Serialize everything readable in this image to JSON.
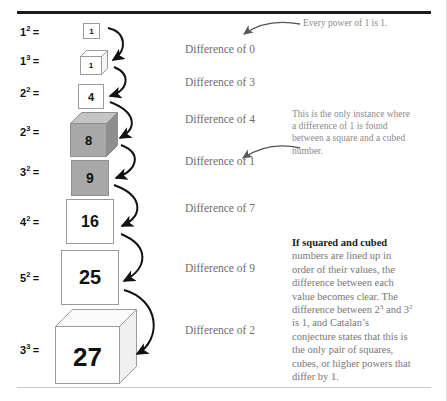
{
  "figure": {
    "title_rule": "top-divider",
    "colors": {
      "ink": "#111111",
      "muted_text": "#6d6d6d",
      "note_text": "#8a8a8a",
      "gray_fill": "#a8a8a8",
      "white_fill": "#ffffff",
      "outline": "#9b9b9b",
      "rule_dark": "#1a1a1a",
      "rule_light": "#c9c9c9"
    }
  },
  "rows": [
    {
      "base": "1",
      "exp": "2",
      "eq": "=",
      "value": "1",
      "shape": "square",
      "fill": "white",
      "label": "1² ="
    },
    {
      "base": "1",
      "exp": "3",
      "eq": "=",
      "value": "1",
      "shape": "cube",
      "fill": "white",
      "label": "1³ ="
    },
    {
      "base": "2",
      "exp": "2",
      "eq": "=",
      "value": "4",
      "shape": "square",
      "fill": "white",
      "label": "2² ="
    },
    {
      "base": "2",
      "exp": "3",
      "eq": "=",
      "value": "8",
      "shape": "cube",
      "fill": "gray",
      "label": "2³ ="
    },
    {
      "base": "3",
      "exp": "2",
      "eq": "=",
      "value": "9",
      "shape": "square",
      "fill": "gray",
      "label": "3² ="
    },
    {
      "base": "4",
      "exp": "2",
      "eq": "=",
      "value": "16",
      "shape": "square",
      "fill": "white",
      "label": "4² ="
    },
    {
      "base": "5",
      "exp": "2",
      "eq": "=",
      "value": "25",
      "shape": "square",
      "fill": "white",
      "label": "5² ="
    },
    {
      "base": "3",
      "exp": "3",
      "eq": "=",
      "value": "27",
      "shape": "cube",
      "fill": "white",
      "label": "3³ ="
    }
  ],
  "differences": [
    {
      "text": "Difference of 0"
    },
    {
      "text": "Difference of 3"
    },
    {
      "text": "Difference of 4"
    },
    {
      "text": "Difference of 1"
    },
    {
      "text": "Difference of 7"
    },
    {
      "text": "Difference of 9"
    },
    {
      "text": "Difference of 2"
    }
  ],
  "callouts": [
    {
      "id": "power-of-one",
      "text": "Every power of 1 is 1."
    },
    {
      "id": "only-instance",
      "text": "This is the only instance where a difference of 1 is found between a square and a cubed number."
    }
  ],
  "body_note": {
    "lead": "If squared and cubed",
    "rest_a": " numbers are lined up in order of their values, the difference between each value becomes clear. The difference between 2",
    "sup_a": "3",
    "rest_b": " and 3",
    "sup_b": "2",
    "rest_c": " is 1, and Catalan’s conjecture states that this is the only pair of squares, cubes, or higher powers that differ by 1."
  }
}
